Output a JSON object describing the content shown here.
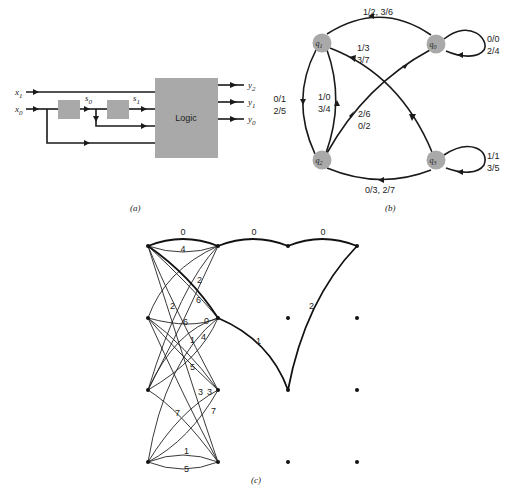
{
  "panel_a": {
    "caption": "(a)",
    "logic_label": "Logic",
    "inputs": [
      {
        "name": "x",
        "sub": "1"
      },
      {
        "name": "x",
        "sub": "0"
      }
    ],
    "internal": [
      {
        "name": "s",
        "sub": "0"
      },
      {
        "name": "s",
        "sub": "1"
      }
    ],
    "outputs": [
      {
        "name": "y",
        "sub": "2"
      },
      {
        "name": "y",
        "sub": "1"
      },
      {
        "name": "y",
        "sub": "0"
      }
    ],
    "colors": {
      "block": "#a9a9a9",
      "wire": "#1a1a1a"
    }
  },
  "panel_b": {
    "caption": "(b)",
    "states": [
      {
        "id": "q0",
        "name": "q",
        "sub": "0"
      },
      {
        "id": "q1",
        "name": "q",
        "sub": "1"
      },
      {
        "id": "q2",
        "name": "q",
        "sub": "2"
      },
      {
        "id": "q3",
        "name": "q",
        "sub": "3"
      }
    ],
    "transitions": [
      {
        "from": "q0",
        "to": "q1",
        "label": [
          "1/2, 3/6"
        ]
      },
      {
        "from": "q0",
        "to": "q0",
        "label": [
          "0/0",
          "2/4"
        ]
      },
      {
        "from": "q1",
        "to": "q3",
        "label": [
          "1/3",
          "3/7"
        ]
      },
      {
        "from": "q1",
        "to": "q2",
        "label": [
          "0/1",
          "2/5"
        ]
      },
      {
        "from": "q2",
        "to": "q1",
        "label": [
          "1/0",
          "3/4"
        ]
      },
      {
        "from": "q2",
        "to": "q0",
        "label": [
          "2/6",
          "0/2"
        ]
      },
      {
        "from": "q3",
        "to": "q3",
        "label": [
          "1/1",
          "3/5"
        ]
      },
      {
        "from": "q3",
        "to": "q2",
        "label": [
          "0/3, 2/7"
        ]
      }
    ],
    "colors": {
      "state": "#a9a9a9"
    }
  },
  "panel_c": {
    "caption": "(c)",
    "stage_labels": {
      "top_0": "0",
      "top_4": "4",
      "a_2": "2",
      "a_6": "6",
      "b_2": "2",
      "b_6": "6",
      "b_0": "0",
      "b_1": "1",
      "b_4": "4",
      "b_5": "5",
      "c_3a": "3",
      "c_3b": "3",
      "c_7a": "7",
      "c_7b": "7",
      "d_1": "1",
      "d_5": "5",
      "path_0a": "0",
      "path_0b": "0",
      "path_1": "1",
      "path_2": "2"
    }
  }
}
